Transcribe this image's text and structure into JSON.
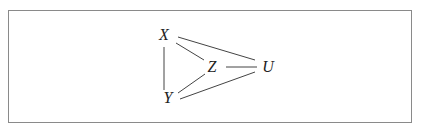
{
  "diagram": {
    "type": "undirected-graph",
    "nodes": [
      {
        "id": "X",
        "label": "X"
      },
      {
        "id": "Y",
        "label": "Y"
      },
      {
        "id": "Z",
        "label": "Z"
      },
      {
        "id": "U",
        "label": "U"
      }
    ],
    "edges": [
      {
        "from": "X",
        "to": "Y"
      },
      {
        "from": "X",
        "to": "Z"
      },
      {
        "from": "X",
        "to": "U"
      },
      {
        "from": "Z",
        "to": "U"
      },
      {
        "from": "Z",
        "to": "Y"
      },
      {
        "from": "Y",
        "to": "U"
      }
    ],
    "colors": {
      "line": "#444444",
      "text": "#222222",
      "frame": "#8a8a8a"
    }
  }
}
